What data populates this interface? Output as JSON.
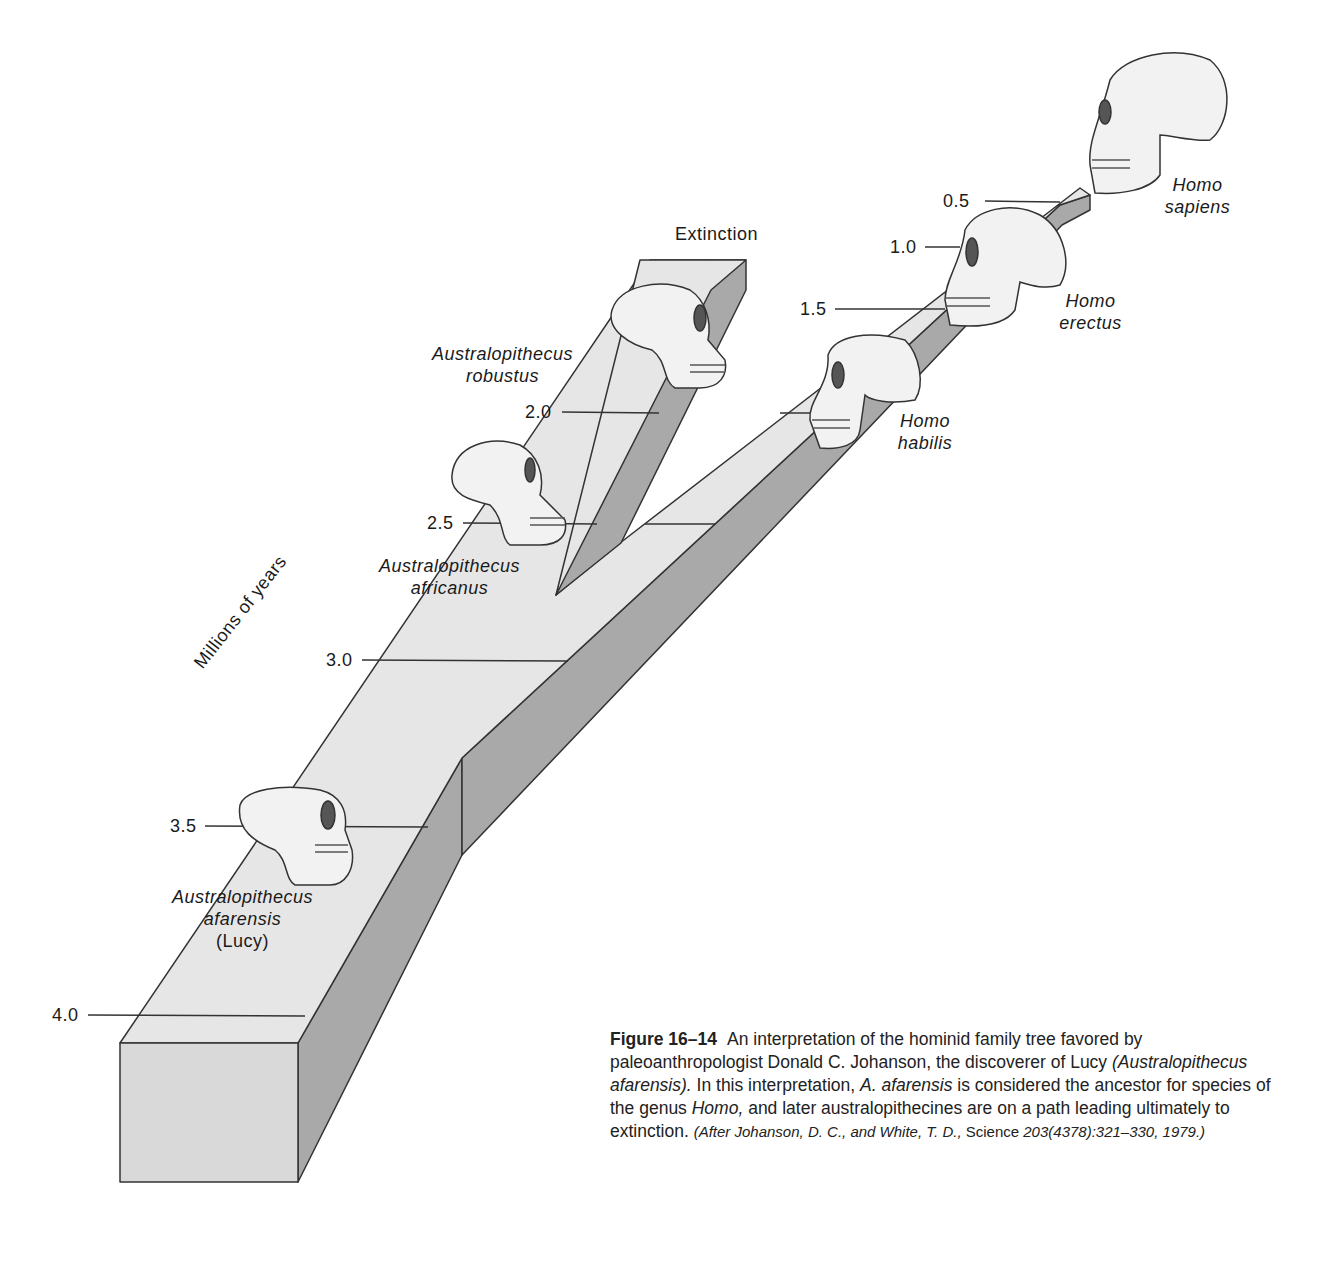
{
  "figure": {
    "axis_label": "Millions of years",
    "extinction_label": "Extinction",
    "ticks": [
      {
        "value": "4.0"
      },
      {
        "value": "3.5"
      },
      {
        "value": "3.0"
      },
      {
        "value": "2.5"
      },
      {
        "value": "2.0"
      },
      {
        "value": "1.5"
      },
      {
        "value": "1.0"
      },
      {
        "value": "0.5"
      }
    ],
    "species": [
      {
        "genus": "Australopithecus",
        "epithet": "afarensis",
        "note": "(Lucy)",
        "age_mya": 3.5
      },
      {
        "genus": "Australopithecus",
        "epithet": "africanus",
        "age_mya": 2.5
      },
      {
        "genus": "Australopithecus",
        "epithet": "robustus",
        "age_mya": 2.0
      },
      {
        "genus": "Homo",
        "epithet": "habilis",
        "age_mya": 2.0
      },
      {
        "genus": "Homo",
        "epithet": "erectus",
        "age_mya": 1.5
      },
      {
        "genus": "Homo",
        "epithet": "sapiens",
        "age_mya": 0.5
      }
    ],
    "icons": [
      "skull-icon"
    ],
    "colors": {
      "top_face": "#e6e6e6",
      "side_face": "#a9a9a9",
      "front_face": "#d9d9d9",
      "outline": "#333333",
      "skull": "#f2f2f2"
    }
  },
  "caption": {
    "figure_number": "Figure 16–14",
    "text_1": "An interpretation of the hominid family tree favored by paleoanthropologist Donald C. Johanson, the discoverer of Lucy ",
    "text_2": "(Australopithecus afarensis).",
    "text_3": " In this interpretation, ",
    "text_4": "A. afarensis",
    "text_5": " is considered the ancestor for species of the genus ",
    "text_6": "Homo,",
    "text_7": " and later australopithecines are on a path leading ultimately to extinction. ",
    "source_1": "(After Johanson, D. C., and White, T. D., ",
    "source_2": "Science",
    "source_3": " 203(4378):321–330, 1979.)"
  }
}
